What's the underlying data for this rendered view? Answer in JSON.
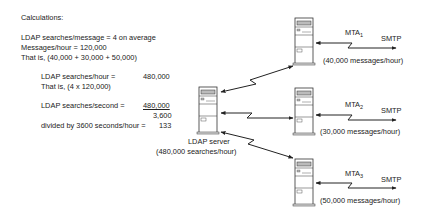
{
  "calculations": {
    "title": "Calculations:",
    "line1": "LDAP searches/message = 4 on average",
    "line2": "Messages/hour = 120,000",
    "line3": "That is, (40,000 + 30,000 + 50,000)",
    "searches_per_hour_label": "LDAP searches/hour =",
    "searches_per_hour_value": "480,000",
    "searches_per_hour_note": "That is, (4 x 120,000)",
    "searches_per_second_label": "LDAP searches/second =",
    "searches_per_second_numerator": "480,000",
    "searches_per_second_denominator": "3,600",
    "divided_label": "divided by 3600 seconds/hour =",
    "divided_result": "133"
  },
  "ldap_server": {
    "name": "LDAP server",
    "load": "(480,000 searches/hour)"
  },
  "mtas": [
    {
      "name": "MTA",
      "subscript": "1",
      "protocol": "SMTP",
      "load": "(40,000 messages/hour)"
    },
    {
      "name": "MTA",
      "subscript": "2",
      "protocol": "SMTP",
      "load": "(30,000 messages/hour)"
    },
    {
      "name": "MTA",
      "subscript": "3",
      "protocol": "SMTP",
      "load": "(50,000 messages/hour)"
    }
  ],
  "colors": {
    "line": "#222222",
    "server_fill": "#ffffff",
    "server_stroke": "#333333",
    "panel_fill": "#bbbbbb"
  }
}
